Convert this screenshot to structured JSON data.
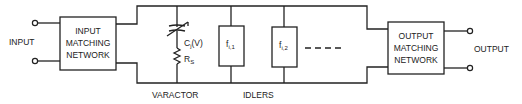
{
  "diagram": {
    "type": "block-circuit",
    "input_label": "INPUT",
    "output_label": "OUTPUT",
    "input_network": {
      "lines": [
        "INPUT",
        "MATCHING",
        "NETWORK"
      ]
    },
    "output_network": {
      "lines": [
        "OUTPUT",
        "MATCHING",
        "NETWORK"
      ]
    },
    "varactor": {
      "capacitance_label_main": "C",
      "capacitance_label_sub": "j",
      "capacitance_label_tail": "(V)",
      "resistance_label_main": "R",
      "resistance_label_sub": "S",
      "caption": "VARACTOR"
    },
    "idlers": {
      "caption": "IDLERS",
      "items": [
        {
          "main": "f",
          "sub": "i,1"
        },
        {
          "main": "f",
          "sub": "i,2"
        }
      ],
      "continuation": "- - - -"
    }
  }
}
